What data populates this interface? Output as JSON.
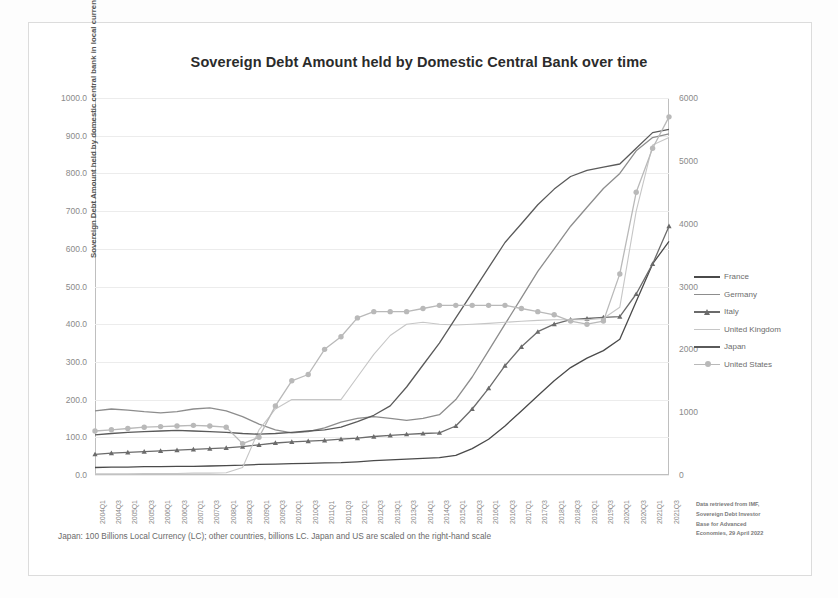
{
  "title": "Sovereign Debt Amount held by Domestic Central Bank over time",
  "footnote": "Japan: 100 Billions Local Currency (LC); other countries, billions LC. Japan and US are scaled on the right-hand scale",
  "source_note": {
    "line1": "Data retrieved from IMF,",
    "line2": "Sovereign Debt Investor",
    "line3": "Base for Advanced",
    "line4": "Economies, 29 April 2022"
  },
  "colors": {
    "france": "#4a4a4a",
    "germany": "#8d8d8d",
    "italy": "#6b6b6b",
    "united_kingdom": "#c6c6c6",
    "japan": "#5a5a5a",
    "united_states": "#b9b9b9",
    "axis": "#bfbfbf",
    "grid": "#ececec",
    "text": "#8a8a8a"
  },
  "chart_data": {
    "type": "line",
    "title": "Sovereign Debt Amount held by Domestic Central Bank over time",
    "xlabel": "",
    "ylabel": "Sovereign Debt Amount held by domestic central bank in local currencies",
    "ylabel_right": "",
    "ylim": [
      0,
      1000
    ],
    "ylim_right": [
      0,
      6000
    ],
    "yticks": [
      "0.0",
      "100.0",
      "200.0",
      "300.0",
      "400.0",
      "500.0",
      "600.0",
      "700.0",
      "800.0",
      "900.0",
      "1000.0"
    ],
    "yticks_right": [
      "0",
      "1000",
      "2000",
      "3000",
      "4000",
      "5000",
      "6000"
    ],
    "grid": true,
    "legend_position": "right",
    "categories": [
      "2004Q1",
      "2004Q3",
      "2005Q1",
      "2005Q3",
      "2006Q1",
      "2006Q3",
      "2007Q1",
      "2007Q3",
      "2008Q1",
      "2008Q3",
      "2009Q1",
      "2009Q3",
      "2010Q1",
      "2010Q3",
      "2011Q1",
      "2011Q3",
      "2012Q1",
      "2012Q3",
      "2013Q1",
      "2013Q3",
      "2014Q1",
      "2014Q3",
      "2015Q1",
      "2015Q3",
      "2016Q1",
      "2016Q3",
      "2017Q1",
      "2017Q3",
      "2018Q1",
      "2018Q3",
      "2019Q1",
      "2019Q3",
      "2020Q1",
      "2020Q3",
      "2021Q1",
      "2021Q3"
    ],
    "series": [
      {
        "name": "France",
        "axis": "left",
        "marker": "none",
        "values": [
          20,
          21,
          21,
          22,
          22,
          23,
          23,
          24,
          25,
          26,
          28,
          29,
          30,
          31,
          32,
          33,
          35,
          38,
          40,
          42,
          44,
          46,
          52,
          70,
          95,
          130,
          170,
          210,
          250,
          285,
          310,
          330,
          360,
          460,
          560,
          620
        ]
      },
      {
        "name": "Germany",
        "axis": "left",
        "marker": "none",
        "values": [
          170,
          175,
          172,
          168,
          165,
          168,
          175,
          178,
          170,
          155,
          135,
          120,
          112,
          115,
          125,
          140,
          150,
          155,
          150,
          145,
          150,
          160,
          200,
          260,
          330,
          400,
          470,
          540,
          600,
          660,
          710,
          760,
          800,
          860,
          895,
          905
        ]
      },
      {
        "name": "Italy",
        "axis": "left",
        "marker": "triangle",
        "values": [
          55,
          58,
          60,
          62,
          64,
          66,
          68,
          70,
          72,
          75,
          80,
          85,
          88,
          90,
          92,
          95,
          98,
          102,
          105,
          108,
          110,
          112,
          130,
          175,
          230,
          290,
          340,
          380,
          400,
          412,
          415,
          418,
          420,
          480,
          560,
          660
        ]
      },
      {
        "name": "United Kingdom",
        "axis": "left",
        "marker": "none",
        "values": [
          3,
          3,
          3,
          4,
          4,
          4,
          5,
          5,
          6,
          20,
          120,
          175,
          200,
          200,
          200,
          200,
          260,
          320,
          370,
          400,
          405,
          400,
          398,
          400,
          402,
          405,
          408,
          410,
          412,
          412,
          412,
          415,
          445,
          700,
          875,
          895
        ]
      },
      {
        "name": "Japan",
        "axis": "right",
        "marker": "none",
        "values": [
          640,
          660,
          680,
          690,
          700,
          710,
          700,
          690,
          680,
          660,
          650,
          660,
          680,
          700,
          720,
          760,
          850,
          950,
          1100,
          1400,
          1750,
          2100,
          2500,
          2900,
          3300,
          3700,
          4000,
          4300,
          4550,
          4750,
          4850,
          4900,
          4950,
          5200,
          5450,
          5500
        ]
      },
      {
        "name": "United States",
        "axis": "right",
        "marker": "circle",
        "values": [
          700,
          720,
          740,
          760,
          770,
          780,
          790,
          780,
          760,
          500,
          600,
          1100,
          1500,
          1600,
          2000,
          2200,
          2500,
          2600,
          2600,
          2600,
          2650,
          2700,
          2700,
          2700,
          2700,
          2700,
          2650,
          2600,
          2550,
          2450,
          2400,
          2450,
          3200,
          4500,
          5200,
          5700
        ]
      }
    ]
  },
  "legend": {
    "items": [
      {
        "label": "France",
        "marker": "line",
        "color_key": "france"
      },
      {
        "label": "Germany",
        "marker": "line",
        "color_key": "germany"
      },
      {
        "label": "Italy",
        "marker": "triangle",
        "color_key": "italy"
      },
      {
        "label": "United Kingdom",
        "marker": "line",
        "color_key": "united_kingdom"
      },
      {
        "label": "Japan",
        "marker": "line",
        "color_key": "japan"
      },
      {
        "label": "United States",
        "marker": "circle",
        "color_key": "united_states"
      }
    ]
  }
}
